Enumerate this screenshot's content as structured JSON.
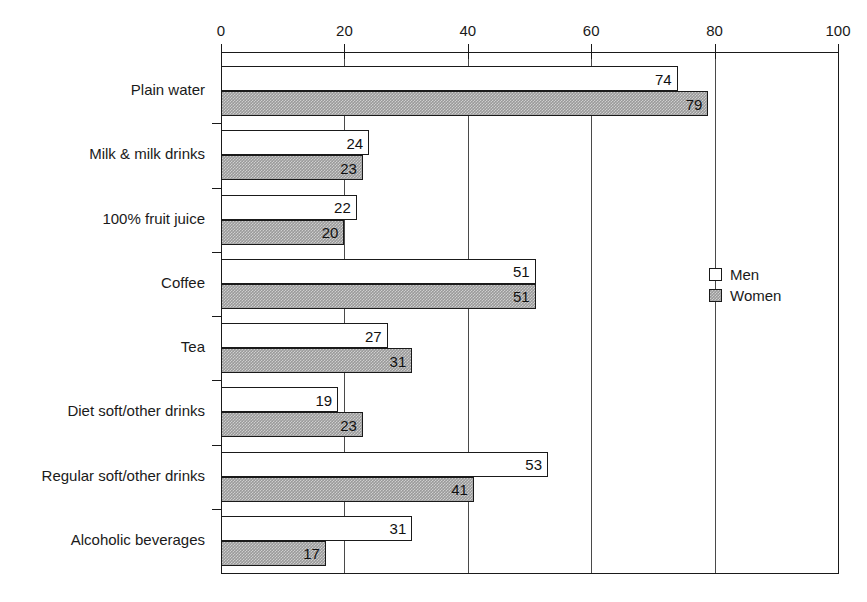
{
  "chart_data": {
    "type": "bar",
    "orientation": "horizontal",
    "title": "",
    "xlabel": "",
    "ylabel": "",
    "xlim": [
      0,
      100
    ],
    "xticks": [
      0,
      20,
      40,
      60,
      80,
      100
    ],
    "xtick_labels": [
      "0",
      "20",
      "40",
      "60",
      "80",
      "100"
    ],
    "grid": true,
    "grid_axis": "x",
    "legend_position": "right-middle",
    "categories": [
      "Plain water",
      "Milk & milk drinks",
      "100% fruit juice",
      "Coffee",
      "Tea",
      "Diet soft/other drinks",
      "Regular soft/other drinks",
      "Alcoholic beverages"
    ],
    "series": [
      {
        "name": "Men",
        "fill": "white",
        "values": [
          74,
          24,
          22,
          51,
          27,
          19,
          53,
          31
        ],
        "value_labels": [
          "74",
          "24",
          "22",
          "51",
          "27",
          "19",
          "53",
          "31"
        ]
      },
      {
        "name": "Women",
        "fill": "gray-hatch",
        "values": [
          79,
          23,
          20,
          51,
          31,
          23,
          41,
          17
        ],
        "value_labels": [
          "79",
          "23",
          "20",
          "51",
          "31",
          "23",
          "41",
          "17"
        ]
      }
    ]
  },
  "legend": {
    "items": [
      {
        "label": "Men",
        "swatch": "white-square-icon"
      },
      {
        "label": "Women",
        "swatch": "gray-hatched-square-icon"
      }
    ]
  },
  "colors": {
    "axis": "#1a1a1a",
    "grid": "#4a4a4a",
    "men_fill": "#ffffff",
    "women_fill": "#9a9a9a",
    "text": "#1a1a1a",
    "background": "#ffffff"
  }
}
